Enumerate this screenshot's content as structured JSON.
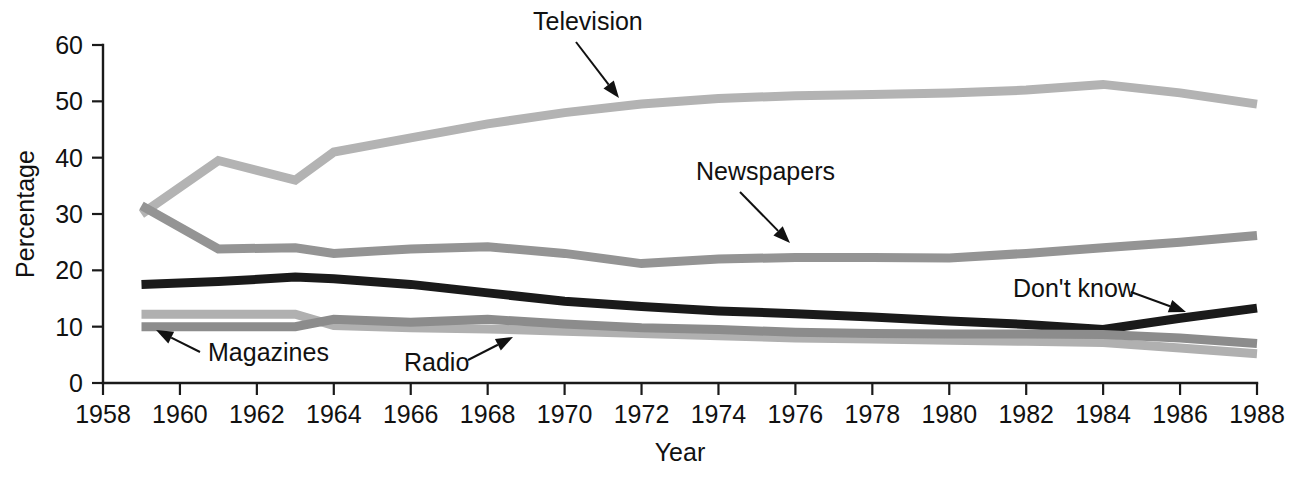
{
  "chart_data": {
    "type": "line",
    "title": "",
    "xlabel": "Year",
    "ylabel": "Percentage",
    "xlim": [
      1958,
      1988
    ],
    "ylim": [
      0,
      60
    ],
    "xticks": [
      1958,
      1960,
      1962,
      1964,
      1966,
      1968,
      1970,
      1972,
      1974,
      1976,
      1978,
      1980,
      1982,
      1984,
      1986,
      1988
    ],
    "yticks": [
      0,
      10,
      20,
      30,
      40,
      50,
      60
    ],
    "grid": false,
    "legend_position": "inline-annotations",
    "x": [
      1959,
      1961,
      1963,
      1964,
      1966,
      1968,
      1970,
      1972,
      1974,
      1976,
      1978,
      1980,
      1982,
      1984,
      1986,
      1988
    ],
    "series": [
      {
        "name": "Television",
        "color": "#b3b3b3",
        "values": [
          30.0,
          39.5,
          36.0,
          41.0,
          43.5,
          46.0,
          48.0,
          49.5,
          50.5,
          51.0,
          51.2,
          51.5,
          52.0,
          53.0,
          51.5,
          49.5
        ]
      },
      {
        "name": "Newspapers",
        "color": "#949494",
        "values": [
          31.5,
          23.8,
          24.0,
          23.0,
          23.8,
          24.2,
          23.0,
          21.2,
          22.0,
          22.3,
          22.3,
          22.2,
          23.0,
          24.0,
          25.0,
          26.2
        ]
      },
      {
        "name": "Don't know",
        "color": "#1a1a1a",
        "values": [
          17.5,
          18.0,
          18.8,
          18.5,
          17.5,
          16.0,
          14.5,
          13.6,
          12.8,
          12.3,
          11.7,
          11.0,
          10.4,
          9.5,
          11.5,
          13.3
        ]
      },
      {
        "name": "Magazines",
        "color": "#b0b0b0",
        "values": [
          12.2,
          12.2,
          12.2,
          10.2,
          9.8,
          9.6,
          9.2,
          8.8,
          8.4,
          8.0,
          7.8,
          7.6,
          7.4,
          7.2,
          6.2,
          5.2
        ]
      },
      {
        "name": "Radio",
        "color": "#8c8c8c",
        "values": [
          10.0,
          10.0,
          10.0,
          11.3,
          10.8,
          11.3,
          10.5,
          9.8,
          9.5,
          9.0,
          8.8,
          8.7,
          8.7,
          8.6,
          8.0,
          7.0
        ]
      }
    ],
    "annotations": [
      {
        "label": "Television",
        "text_x": 533,
        "text_y": 30,
        "arrow_from": [
          576,
          42
        ],
        "arrow_to": [
          619,
          98
        ]
      },
      {
        "label": "Newspapers",
        "text_x": 696,
        "text_y": 180,
        "arrow_from": [
          740,
          192
        ],
        "arrow_to": [
          790,
          243
        ]
      },
      {
        "label": "Don't know",
        "text_x": 1013,
        "text_y": 297,
        "arrow_from": [
          1131,
          292
        ],
        "arrow_to": [
          1186,
          312
        ]
      },
      {
        "label": "Magazines",
        "text_x": 208,
        "text_y": 361,
        "arrow_from": [
          200,
          352
        ],
        "arrow_to": [
          156,
          330
        ]
      },
      {
        "label": "Radio",
        "text_x": 404,
        "text_y": 371,
        "arrow_from": [
          468,
          360
        ],
        "arrow_to": [
          513,
          337
        ]
      }
    ]
  }
}
